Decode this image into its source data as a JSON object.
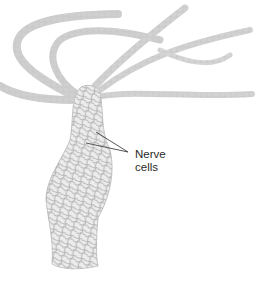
{
  "figure": {
    "label": {
      "line1": "Nerve",
      "line2": "cells"
    },
    "colors": {
      "background": "#ffffff",
      "body_fill": "#ececec",
      "net_stroke": "#a8a8a8",
      "tentacle_stroke": "#c4c4c4",
      "leader_line": "#444444",
      "label_text": "#2a2a2a"
    }
  }
}
